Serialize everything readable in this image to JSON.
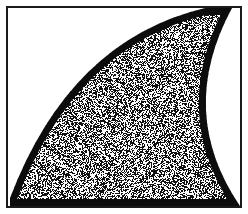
{
  "figure": {
    "caption": "",
    "width": 248,
    "height": 214,
    "background_color": "#ffffff",
    "ink_color": "#111111",
    "frame": {
      "name": "rectangular border",
      "left": 6,
      "top": 6,
      "right": 242,
      "bottom": 208,
      "stroke_width": 2,
      "color": "#1a1a1a"
    },
    "shape": {
      "name": "shark-fin crescent",
      "fill_style": "random-stipple",
      "stipple_density": 0.5,
      "stipple_grain_px": 1,
      "outline_width": 7,
      "outline_color": "#0d0d0d",
      "outer_curve": {
        "description": "concave-up arc from top border near x=205 sweeping left and down to left border near y=198",
        "start": [
          205,
          8
        ],
        "control": [
          70,
          40
        ],
        "end": [
          10,
          198
        ]
      },
      "inner_curve": {
        "description": "concave arc from top-right corner area down to bottom-right corner, carving a white lobe out of the right side",
        "start": [
          232,
          8
        ],
        "control": [
          176,
          112
        ],
        "end": [
          240,
          206
        ]
      },
      "bottom_edge": {
        "description": "shape fills to the bottom border between x=10 and x=240",
        "y": 206
      }
    },
    "white_regions": [
      {
        "name": "upper-left void",
        "description": "large white area above the outer curve"
      },
      {
        "name": "right lobe void",
        "description": "white crescent lobe intruding from the right border"
      }
    ]
  }
}
